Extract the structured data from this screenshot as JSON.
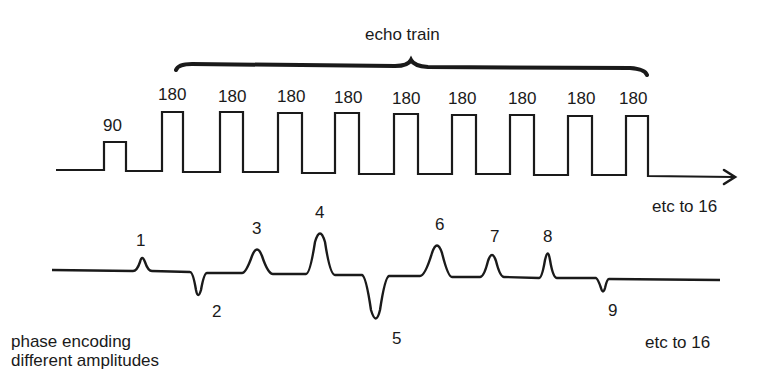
{
  "title": "echo train",
  "rf": {
    "excitation_label": "90",
    "refocus_label": "180",
    "refocus_count": 9,
    "continuation_label": "etc to 16"
  },
  "gradient": {
    "description_line1": "phase encoding",
    "description_line2": "different amplitudes",
    "lobes": [
      {
        "label": "1",
        "polarity": "positive",
        "relative_amplitude": 0.4
      },
      {
        "label": "2",
        "polarity": "negative",
        "relative_amplitude": 0.55
      },
      {
        "label": "3",
        "polarity": "positive",
        "relative_amplitude": 0.6
      },
      {
        "label": "4",
        "polarity": "positive",
        "relative_amplitude": 1.0
      },
      {
        "label": "5",
        "polarity": "negative",
        "relative_amplitude": 1.0
      },
      {
        "label": "6",
        "polarity": "positive",
        "relative_amplitude": 0.75
      },
      {
        "label": "7",
        "polarity": "positive",
        "relative_amplitude": 0.55
      },
      {
        "label": "8",
        "polarity": "positive",
        "relative_amplitude": 0.55
      },
      {
        "label": "9",
        "polarity": "negative",
        "relative_amplitude": 0.35
      }
    ],
    "continuation_label": "etc to 16"
  },
  "colors": {
    "line": "#1a1a1a",
    "background": "#ffffff"
  }
}
